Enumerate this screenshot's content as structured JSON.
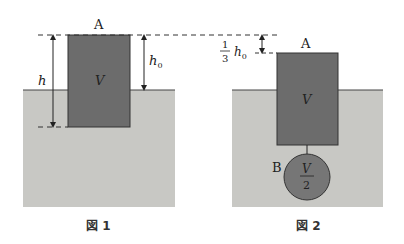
{
  "colors": {
    "water": "#c8c8c4",
    "block": "#6c6c6c",
    "ball": "#767676",
    "line": "#333333"
  },
  "figure1": {
    "caption": "図 1",
    "block_top_label": "A",
    "block_volume_label": "V",
    "depth_label": "h",
    "height_above_label": "h",
    "height_above_subscript": "0"
  },
  "figure2": {
    "caption": "図 2",
    "block_top_label": "A",
    "block_volume_label": "V",
    "offset_label_num": "1",
    "offset_label_den": "3",
    "offset_label_var": "h",
    "offset_label_sub": "0",
    "ball_label": "B",
    "ball_volume_num": "V",
    "ball_volume_den": "2"
  }
}
